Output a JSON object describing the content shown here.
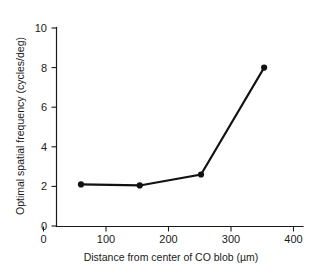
{
  "chart_data": {
    "type": "line",
    "title": "",
    "xlabel": "Distance from center of CO blob (µm)",
    "ylabel": "Optimal spatial frequency (cycles/deg)",
    "xlim": [
      0,
      415
    ],
    "ylim": [
      0,
      10.2
    ],
    "xticks": [
      0,
      100,
      200,
      300,
      400
    ],
    "xtick_labels": [
      "0",
      "100",
      "200",
      "300",
      "400"
    ],
    "yticks": [
      0,
      2,
      4,
      6,
      8,
      10
    ],
    "ytick_labels": [
      "0",
      "2",
      "4",
      "6",
      "8",
      "10"
    ],
    "grid": false,
    "legend": "none",
    "marker": "filled-circle",
    "line_color": "#111111",
    "marker_color": "#111111",
    "axis_color": "#1a1a1a",
    "background_color": "#ffffff",
    "series": [
      {
        "name": "Optimal spatial frequency",
        "x": [
          60,
          154,
          252,
          353
        ],
        "y": [
          2.1,
          2.05,
          2.6,
          8.0
        ]
      }
    ]
  },
  "axis": {
    "x_label": "Distance from center of CO blob (µm)",
    "y_label": "Optimal spatial frequency (cycles/deg)"
  },
  "xtick_0": "0",
  "xtick_1": "100",
  "xtick_2": "200",
  "xtick_3": "300",
  "xtick_4": "400",
  "ytick_0": "0",
  "ytick_1": "2",
  "ytick_2": "4",
  "ytick_3": "6",
  "ytick_4": "8",
  "ytick_5": "10"
}
